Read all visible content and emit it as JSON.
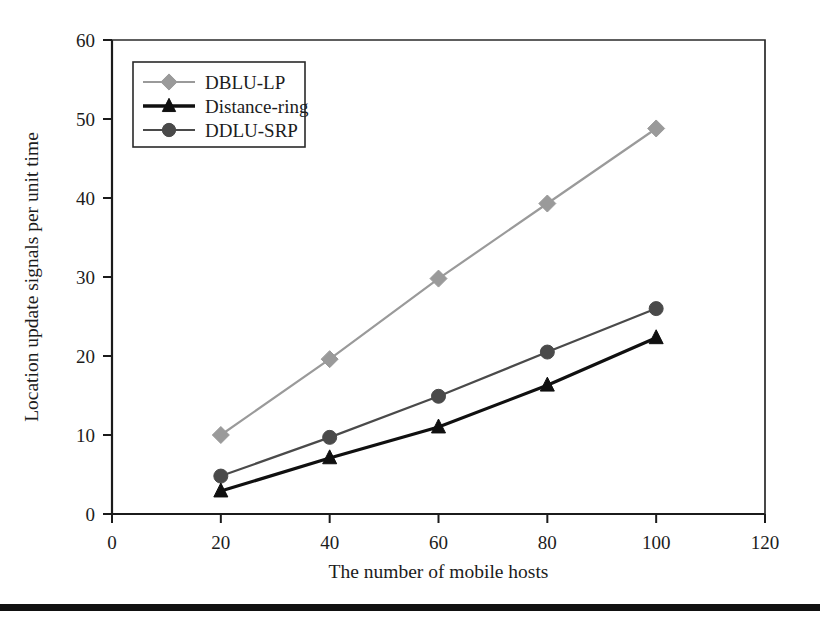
{
  "chart_data": {
    "type": "line",
    "title": "",
    "xlabel": "The number of mobile hosts",
    "ylabel": "Location update signals per unit time",
    "x": [
      20,
      40,
      60,
      80,
      100
    ],
    "xlim": [
      0,
      120
    ],
    "ylim": [
      0,
      60
    ],
    "xticks": [
      0,
      20,
      40,
      60,
      80,
      100,
      120
    ],
    "yticks": [
      0,
      10,
      20,
      30,
      40,
      50,
      60
    ],
    "xtick_labels": [
      "0",
      "20",
      "40",
      "60",
      "80",
      "100",
      "120"
    ],
    "ytick_labels": [
      "0",
      "10",
      "20",
      "30",
      "40",
      "50",
      "60"
    ],
    "grid": false,
    "legend_position": "upper-left-inset",
    "series": [
      {
        "name": "DBLU-LP",
        "marker": "diamond",
        "color": "#9a9a9a",
        "values": [
          10.0,
          19.6,
          29.8,
          39.3,
          48.8
        ]
      },
      {
        "name": "Distance-ring",
        "marker": "triangle",
        "color": "#101010",
        "values": [
          2.9,
          7.1,
          11.0,
          16.3,
          22.3
        ]
      },
      {
        "name": "DDLU-SRP",
        "marker": "circle",
        "color": "#4a4a4a",
        "values": [
          4.8,
          9.7,
          14.9,
          20.5,
          26.0
        ]
      }
    ]
  },
  "legend": {
    "entries": [
      {
        "label": "DBLU-LP"
      },
      {
        "label": "Distance-ring"
      },
      {
        "label": "DDLU-SRP"
      }
    ]
  },
  "axes": {
    "x_title": "The number of mobile hosts",
    "y_title": "Location update signals per unit time",
    "x_labels": [
      "0",
      "20",
      "40",
      "60",
      "80",
      "100",
      "120"
    ],
    "y_labels": [
      "0",
      "10",
      "20",
      "30",
      "40",
      "50",
      "60"
    ]
  }
}
